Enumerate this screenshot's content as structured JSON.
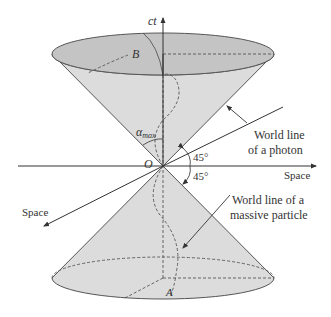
{
  "diagram": {
    "labels": {
      "time_axis": "ct",
      "space_right": "Space",
      "space_diag": "Space",
      "point_top": "B",
      "point_bottom": "A",
      "origin": "O",
      "alpha_symbol": "α",
      "alpha_sub": "max",
      "angle_upper": "45°",
      "angle_lower": "45°",
      "photon_line1": "World line",
      "photon_line2": "of a photon",
      "particle_line1": "World line of a",
      "particle_line2": "massive particle"
    },
    "colors": {
      "cone_fill": "#dcdcdc",
      "top_ellipse_fill": "#c4c4c4",
      "stroke": "#444444",
      "text": "#333333"
    }
  }
}
